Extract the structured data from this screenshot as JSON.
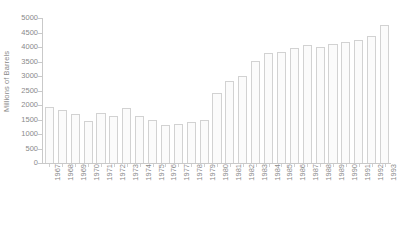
{
  "chart_data": {
    "type": "bar",
    "title": "",
    "xlabel": "",
    "ylabel": "Millions of Barrels",
    "ylim": [
      0,
      5000
    ],
    "ytick_step": 500,
    "yticks": [
      0,
      500,
      1000,
      1500,
      2000,
      2500,
      3000,
      3500,
      4000,
      4500,
      5000
    ],
    "ytick_labels": [
      "0",
      "500",
      "1000",
      "1500",
      "2000",
      "2500",
      "3000",
      "3500",
      "4000",
      "4500",
      "5000"
    ],
    "grid": false,
    "legend": null,
    "categories": [
      "1967",
      "1968",
      "1969",
      "1970",
      "1971",
      "1972",
      "1973",
      "1974",
      "1975",
      "1976",
      "1977",
      "1978",
      "1979",
      "1980",
      "1981",
      "1982",
      "1983",
      "1984",
      "1985",
      "1986",
      "1987",
      "1988",
      "1989",
      "1990",
      "1991",
      "1992",
      "1993"
    ],
    "values": [
      1930,
      1820,
      1700,
      1450,
      1720,
      1630,
      1880,
      1620,
      1500,
      1320,
      1330,
      1420,
      1490,
      2400,
      2840,
      3010,
      3520,
      3800,
      3830,
      3980,
      4060,
      4000,
      4120,
      4160,
      4240,
      4380,
      4750
    ],
    "bar_fill_color": "#fbfbfb",
    "bar_border_color": "#d2d2d2",
    "axis_color": "#c9c9c9",
    "text_color": "#8a8a8a"
  }
}
